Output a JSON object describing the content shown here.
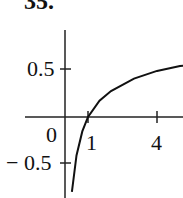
{
  "problem_label": "35.",
  "chart_data": {
    "type": "line",
    "title": "",
    "xlabel": "",
    "ylabel": "",
    "x_ticks": [
      "0",
      "1",
      "4"
    ],
    "y_ticks": [
      "0.5",
      "-0.5"
    ],
    "xlim": [
      0,
      5.7
    ],
    "ylim": [
      -0.8,
      0.9
    ],
    "grid": false,
    "series": [
      {
        "name": "curve",
        "x": [
          0.3,
          0.5,
          0.75,
          1.0,
          1.5,
          2.0,
          3.0,
          4.0,
          5.0,
          5.7
        ],
        "y": [
          -0.78,
          -0.4,
          -0.15,
          0.0,
          0.17,
          0.27,
          0.4,
          0.48,
          0.53,
          0.55
        ]
      }
    ]
  },
  "labels": {
    "x0": "0",
    "x1": "1",
    "x4": "4",
    "yp": "0.5",
    "yn": "− 0.5"
  }
}
